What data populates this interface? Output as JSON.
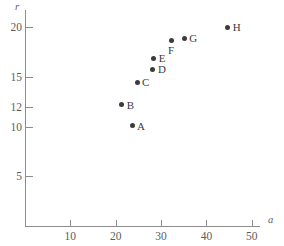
{
  "chart_data": {
    "type": "scatter",
    "title": "",
    "xlabel": "a",
    "ylabel": "r",
    "xlim": [
      0,
      52.2
    ],
    "ylim": [
      0,
      22.7
    ],
    "grid": false,
    "legend": "none",
    "xticks": [
      10,
      20,
      30,
      40,
      50
    ],
    "xtick_labels": [
      "10",
      "20",
      "30",
      "40",
      "50"
    ],
    "yticks": [
      5,
      10,
      12,
      15,
      20
    ],
    "ytick_labels": [
      "5",
      "10",
      "12",
      "15",
      "20"
    ],
    "point_color": "#3b3b3b",
    "axis_color": "#8e8e8e",
    "points": [
      {
        "label": "A",
        "x": 23.6,
        "y": 10.1,
        "label_pos": "right"
      },
      {
        "label": "B",
        "x": 21.3,
        "y": 12.2,
        "label_pos": "right"
      },
      {
        "label": "C",
        "x": 24.7,
        "y": 14.5,
        "label_pos": "right"
      },
      {
        "label": "D",
        "x": 28.2,
        "y": 15.8,
        "label_pos": "right"
      },
      {
        "label": "E",
        "x": 28.4,
        "y": 16.9,
        "label_pos": "right"
      },
      {
        "label": "F",
        "x": 32.2,
        "y": 18.7,
        "label_pos": "below"
      },
      {
        "label": "G",
        "x": 35.1,
        "y": 18.9,
        "label_pos": "right"
      },
      {
        "label": "H",
        "x": 44.7,
        "y": 20.0,
        "label_pos": "right"
      }
    ]
  }
}
